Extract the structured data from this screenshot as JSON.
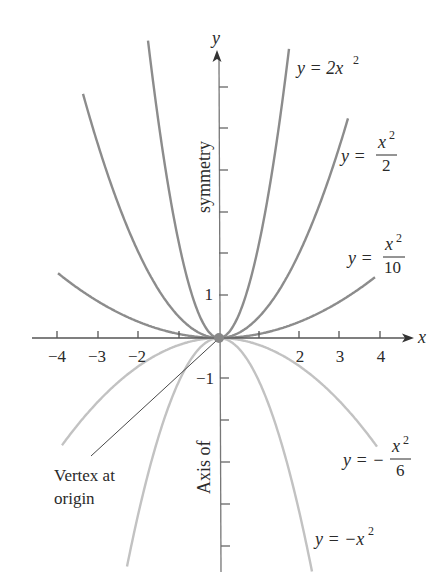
{
  "chart_data": {
    "type": "line",
    "title": "",
    "xlabel": "x",
    "ylabel": "y",
    "xlim": [
      -4.5,
      4.5
    ],
    "ylim": [
      -6,
      7
    ],
    "grid": false,
    "legend": "none (curves labeled inline)",
    "x_ticks": [
      -4,
      -3,
      -2,
      -1,
      1,
      2,
      3,
      4
    ],
    "x_tick_labels": [
      "-4",
      "-3",
      "-2",
      "",
      "",
      "2",
      "3",
      "4"
    ],
    "y_tick_labels_shown": [
      "1",
      "-1"
    ],
    "axis_title_vertical": [
      "Axis of",
      "symmetry"
    ],
    "annotations": [
      {
        "text": "Vertex at origin",
        "points_to": [
          0,
          0
        ]
      }
    ],
    "series": [
      {
        "name": "y = 2x²",
        "formula": "2*x^2",
        "tone": "dark"
      },
      {
        "name": "y = x²/2",
        "formula": "x^2/2",
        "tone": "dark"
      },
      {
        "name": "y = x²/10",
        "formula": "x^2/10",
        "tone": "dark"
      },
      {
        "name": "y = -x²/6",
        "formula": "-x^2/6",
        "tone": "light"
      },
      {
        "name": "y = -x²",
        "formula": "-x^2",
        "tone": "light"
      }
    ],
    "vertex": [
      0,
      0
    ]
  },
  "labels": {
    "x_axis": "x",
    "y_axis": "y",
    "tick_neg4": "−4",
    "tick_neg3": "−3",
    "tick_neg2": "−2",
    "tick_2": "2",
    "tick_3": "3",
    "tick_4": "4",
    "tick_y1": "1",
    "tick_yneg1": "−1",
    "symmetry": "symmetry",
    "axis_of": "Axis of",
    "vertex_line1": "Vertex at",
    "vertex_line2": "origin",
    "eq_2x2": "y = 2x",
    "eq_2x2_exp": "2",
    "eq_half_lhs": "y =",
    "eq_half_num": "x",
    "eq_half_exp": "2",
    "eq_half_den": "2",
    "eq_tenth_lhs": "y =",
    "eq_tenth_num": "x",
    "eq_tenth_exp": "2",
    "eq_tenth_den": "10",
    "eq_sixth_lhs": "y = −",
    "eq_sixth_num": "x",
    "eq_sixth_exp": "2",
    "eq_sixth_den": "6",
    "eq_neg_lhs": "y = −x",
    "eq_neg_exp": "2"
  },
  "colors": {
    "axis": "#555555",
    "upper_curves": "#8c8c8c",
    "lower_curves": "#c2c2c2",
    "vertex_dot": "#888888",
    "text": "#2a2a2a"
  }
}
